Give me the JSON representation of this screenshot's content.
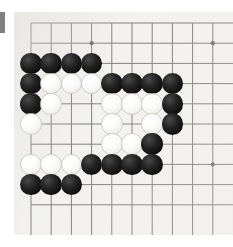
{
  "app": {
    "title": "Go Board Position",
    "kind": "go-board-screenshot"
  },
  "board": {
    "name": "goban",
    "board_color": "#f2f1ee",
    "line_color": "#6b6b6b",
    "columns_visible": 10,
    "rows_visible": 10,
    "grid_spacing_px": 20.2,
    "origin": {
      "x": 17,
      "y": 11
    },
    "star_points": [
      {
        "col": 3,
        "row": 1
      },
      {
        "col": 9,
        "row": 1
      },
      {
        "col": 3,
        "row": 7
      },
      {
        "col": 9,
        "row": 7
      }
    ],
    "star_point_color": "#555555"
  },
  "markers": {
    "edge_bar": {
      "name": "left-edge-bar",
      "color": "#808080"
    }
  },
  "stones": {
    "black_color": "#121212",
    "white_color": "#fbfbfa",
    "black_count": 22,
    "white_count": 16,
    "total_count": 38,
    "list": [
      {
        "color": "black",
        "col": 0,
        "row": 2
      },
      {
        "color": "black",
        "col": 1,
        "row": 2
      },
      {
        "color": "black",
        "col": 2,
        "row": 2
      },
      {
        "color": "black",
        "col": 3,
        "row": 2
      },
      {
        "color": "black",
        "col": 0,
        "row": 3
      },
      {
        "color": "white",
        "col": 1,
        "row": 3
      },
      {
        "color": "white",
        "col": 2,
        "row": 3
      },
      {
        "color": "white",
        "col": 3,
        "row": 3
      },
      {
        "color": "black",
        "col": 4,
        "row": 3
      },
      {
        "color": "black",
        "col": 5,
        "row": 3
      },
      {
        "color": "black",
        "col": 6,
        "row": 3
      },
      {
        "color": "black",
        "col": 7,
        "row": 3
      },
      {
        "color": "black",
        "col": 0,
        "row": 4
      },
      {
        "color": "white",
        "col": 1,
        "row": 4
      },
      {
        "color": "white",
        "col": 4,
        "row": 4
      },
      {
        "color": "white",
        "col": 5,
        "row": 4
      },
      {
        "color": "white",
        "col": 6,
        "row": 4
      },
      {
        "color": "black",
        "col": 7,
        "row": 4
      },
      {
        "color": "white",
        "col": 0,
        "row": 5
      },
      {
        "color": "white",
        "col": 4,
        "row": 5
      },
      {
        "color": "white",
        "col": 6,
        "row": 5
      },
      {
        "color": "black",
        "col": 7,
        "row": 5
      },
      {
        "color": "white",
        "col": 4,
        "row": 6
      },
      {
        "color": "white",
        "col": 5,
        "row": 6
      },
      {
        "color": "black",
        "col": 6,
        "row": 6
      },
      {
        "color": "white",
        "col": 0,
        "row": 7
      },
      {
        "color": "white",
        "col": 1,
        "row": 7
      },
      {
        "color": "white",
        "col": 2,
        "row": 7
      },
      {
        "color": "black",
        "col": 3,
        "row": 7
      },
      {
        "color": "black",
        "col": 4,
        "row": 7
      },
      {
        "color": "black",
        "col": 5,
        "row": 7
      },
      {
        "color": "black",
        "col": 6,
        "row": 7
      },
      {
        "color": "black",
        "col": 0,
        "row": 8
      },
      {
        "color": "black",
        "col": 1,
        "row": 8
      },
      {
        "color": "black",
        "col": 2,
        "row": 8
      }
    ]
  }
}
